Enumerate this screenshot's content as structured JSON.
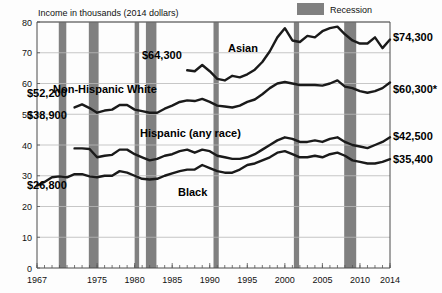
{
  "chart_data": {
    "type": "line",
    "title": "Income in thousands (2014 dollars)",
    "xlabel": "",
    "ylabel": "Income in thousands (2014 dollars)",
    "xlim": [
      1967,
      2014
    ],
    "ylim": [
      0,
      80
    ],
    "grid": true,
    "legend_position": "top-right",
    "y_ticks": [
      "0",
      "10",
      "20",
      "30",
      "40",
      "50",
      "60",
      "70",
      "80"
    ],
    "y_tick_values": [
      0,
      10,
      20,
      30,
      40,
      50,
      60,
      70,
      80
    ],
    "x_ticks": [
      "1967",
      "1975",
      "1980",
      "1985",
      "1990",
      "1995",
      "2000",
      "2005",
      "2010",
      "2014"
    ],
    "x_tick_values": [
      1967,
      1975,
      1980,
      1985,
      1990,
      1995,
      2000,
      2005,
      2010,
      2014
    ],
    "legend": [
      {
        "label": "Recession",
        "color": "#808080",
        "type": "band"
      }
    ],
    "series": [
      {
        "name": "Asian",
        "label": "Asian",
        "start_label": "$64,300",
        "end_label": "$74,300",
        "x": [
          1987,
          1988,
          1989,
          1990,
          1991,
          1992,
          1993,
          1994,
          1995,
          1996,
          1997,
          1998,
          1999,
          2000,
          2001,
          2002,
          2003,
          2004,
          2005,
          2006,
          2007,
          2008,
          2009,
          2010,
          2011,
          2012,
          2013,
          2014
        ],
        "values": [
          64.3,
          64.0,
          66.0,
          64.0,
          61.5,
          61.0,
          62.5,
          62.0,
          63.0,
          64.5,
          67.0,
          70.5,
          75.0,
          78.0,
          74.0,
          73.5,
          75.5,
          75.0,
          77.0,
          78.0,
          78.5,
          76.0,
          74.0,
          73.0,
          73.0,
          75.0,
          71.5,
          74.3
        ]
      },
      {
        "name": "Non-Hispanic White",
        "label": "Non-Hispanic White",
        "start_label": "$52,200",
        "end_label": "$60,300*",
        "x": [
          1972,
          1973,
          1974,
          1975,
          1976,
          1977,
          1978,
          1979,
          1980,
          1981,
          1982,
          1983,
          1984,
          1985,
          1986,
          1987,
          1988,
          1989,
          1990,
          1991,
          1992,
          1993,
          1994,
          1995,
          1996,
          1997,
          1998,
          1999,
          2000,
          2001,
          2002,
          2003,
          2004,
          2005,
          2006,
          2007,
          2008,
          2009,
          2010,
          2011,
          2012,
          2013,
          2014
        ],
        "values": [
          52.2,
          53.2,
          52.0,
          50.5,
          51.2,
          51.5,
          53.0,
          53.0,
          51.5,
          51.0,
          50.5,
          50.5,
          51.8,
          52.8,
          54.0,
          54.5,
          54.3,
          55.0,
          54.0,
          52.8,
          52.5,
          52.2,
          52.8,
          54.0,
          54.8,
          56.5,
          58.5,
          60.0,
          60.5,
          60.0,
          59.5,
          59.5,
          59.5,
          59.3,
          60.0,
          61.0,
          59.0,
          58.5,
          57.5,
          57.0,
          57.5,
          58.5,
          60.3
        ]
      },
      {
        "name": "Hispanic (any race)",
        "label": "Hispanic (any race)",
        "start_label": "$38,900",
        "end_label": "$42,500",
        "x": [
          1972,
          1973,
          1974,
          1975,
          1976,
          1977,
          1978,
          1979,
          1980,
          1981,
          1982,
          1983,
          1984,
          1985,
          1986,
          1987,
          1988,
          1989,
          1990,
          1991,
          1992,
          1993,
          1994,
          1995,
          1996,
          1997,
          1998,
          1999,
          2000,
          2001,
          2002,
          2003,
          2004,
          2005,
          2006,
          2007,
          2008,
          2009,
          2010,
          2011,
          2012,
          2013,
          2014
        ],
        "values": [
          38.9,
          38.9,
          38.7,
          36.0,
          36.5,
          36.8,
          38.5,
          38.5,
          37.0,
          36.0,
          35.0,
          35.5,
          36.5,
          37.0,
          38.0,
          38.5,
          37.5,
          38.5,
          38.0,
          36.5,
          36.0,
          35.5,
          35.5,
          36.0,
          37.0,
          38.5,
          40.0,
          41.5,
          42.5,
          42.0,
          41.0,
          41.0,
          41.5,
          41.0,
          42.0,
          42.5,
          41.0,
          40.0,
          39.5,
          39.0,
          40.0,
          41.0,
          42.5
        ]
      },
      {
        "name": "Black",
        "label": "Black",
        "start_label": "$26,800",
        "end_label": "$35,400",
        "x": [
          1967,
          1968,
          1969,
          1970,
          1971,
          1972,
          1973,
          1974,
          1975,
          1976,
          1977,
          1978,
          1979,
          1980,
          1981,
          1982,
          1983,
          1984,
          1985,
          1986,
          1987,
          1988,
          1989,
          1990,
          1991,
          1992,
          1993,
          1994,
          1995,
          1996,
          1997,
          1998,
          1999,
          2000,
          2001,
          2002,
          2003,
          2004,
          2005,
          2006,
          2007,
          2008,
          2009,
          2010,
          2011,
          2012,
          2013,
          2014
        ],
        "values": [
          26.8,
          28.0,
          29.5,
          29.8,
          29.5,
          30.5,
          30.5,
          29.8,
          29.5,
          30.0,
          30.0,
          31.5,
          31.0,
          30.0,
          29.0,
          28.8,
          29.0,
          30.0,
          30.8,
          31.5,
          32.0,
          32.0,
          33.5,
          32.5,
          31.5,
          31.0,
          31.0,
          32.0,
          33.5,
          34.0,
          35.0,
          36.0,
          37.5,
          38.0,
          37.0,
          36.0,
          36.0,
          36.5,
          36.0,
          37.0,
          37.5,
          36.5,
          35.0,
          34.5,
          34.0,
          34.0,
          34.5,
          35.4
        ]
      }
    ],
    "recessions": [
      {
        "start": 1969.9,
        "end": 1970.9
      },
      {
        "start": 1973.9,
        "end": 1975.2
      },
      {
        "start": 1980.0,
        "end": 1980.6
      },
      {
        "start": 1981.5,
        "end": 1982.9
      },
      {
        "start": 1990.5,
        "end": 1991.2
      },
      {
        "start": 2001.2,
        "end": 2001.9
      },
      {
        "start": 2007.9,
        "end": 2009.5
      }
    ],
    "annotations": [
      {
        "text": "$64,300",
        "series": "Asian",
        "position": "left"
      },
      {
        "text": "$74,300",
        "series": "Asian",
        "position": "right"
      },
      {
        "text": "$52,200",
        "series": "Non-Hispanic White",
        "position": "left"
      },
      {
        "text": "$60,300*",
        "series": "Non-Hispanic White",
        "position": "right"
      },
      {
        "text": "$38,900",
        "series": "Hispanic (any race)",
        "position": "left"
      },
      {
        "text": "$42,500",
        "series": "Hispanic (any race)",
        "position": "right"
      },
      {
        "text": "$26,800",
        "series": "Black",
        "position": "left"
      },
      {
        "text": "$35,400",
        "series": "Black",
        "position": "right"
      }
    ]
  }
}
